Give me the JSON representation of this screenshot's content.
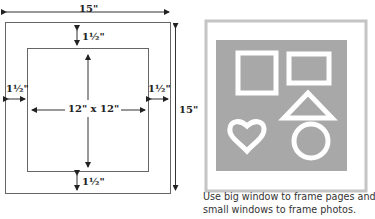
{
  "left_diagram": {
    "outer_width_label": "15\"",
    "outer_height_label": "15\"",
    "top_margin_label": "1½\"",
    "bottom_margin_label": "1½\"",
    "left_margin_label": "1½\"",
    "right_margin_label": "1½\"",
    "window_label": "12\" x 12\""
  },
  "right_illustration": {
    "shapes": [
      "square",
      "rectangle",
      "triangle",
      "heart",
      "circle"
    ],
    "colors": {
      "frame_border": "#c8c8c8",
      "mat_fill": "#a9a9a9",
      "shape_stroke": "#ffffff"
    }
  },
  "caption": {
    "line1": "Use big window to frame pages and",
    "line2": "small windows to frame photos."
  }
}
